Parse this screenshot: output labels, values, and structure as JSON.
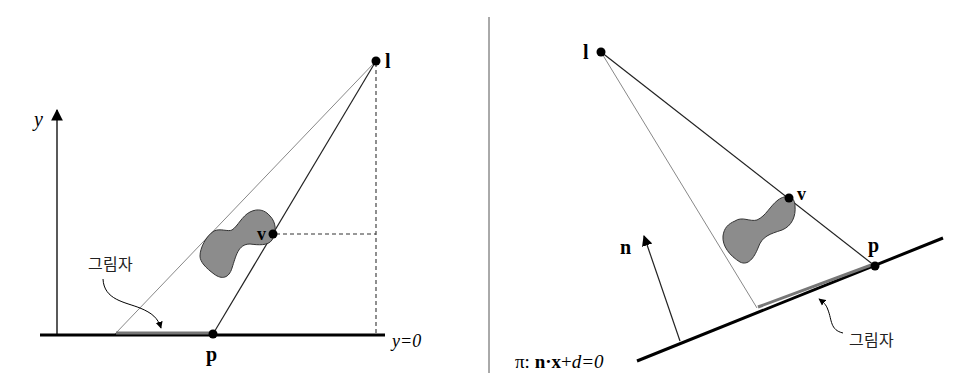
{
  "left_panel": {
    "labels": {
      "light": "l",
      "vertex": "v",
      "projected_point": "p",
      "y_axis": "y",
      "ground_equation": "y=0",
      "shadow": "그림자"
    }
  },
  "right_panel": {
    "labels": {
      "light": "l",
      "vertex": "v",
      "projected_point": "p",
      "normal": "n",
      "plane_prefix": "π: ",
      "plane_n": "n",
      "plane_dot": "·",
      "plane_x": "x",
      "plane_plus": "+",
      "plane_d": "d",
      "plane_eq_zero": "=0",
      "shadow": "그림자"
    }
  },
  "colors": {
    "line": "#000000",
    "thin_line": "#333333",
    "light_ray": "#888888",
    "object_fill": "#8a8a8a",
    "shadow": "#777777",
    "separator": "#555555"
  }
}
